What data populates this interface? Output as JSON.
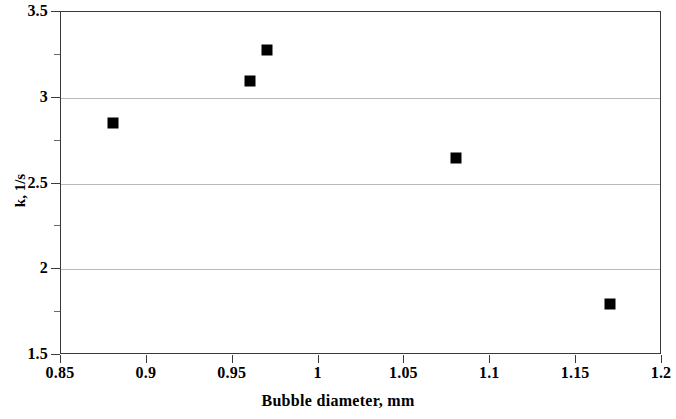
{
  "chart_data": {
    "type": "scatter",
    "title": "",
    "xlabel": "Bubble diameter, mm",
    "ylabel": "k, 1/s",
    "xlim": [
      0.85,
      1.2
    ],
    "ylim": [
      1.5,
      3.5
    ],
    "grid": "horizontal-major",
    "legend": "none",
    "marker": "filled-square-black",
    "marker_color": "#000000",
    "x": [
      0.88,
      0.96,
      0.97,
      1.08,
      1.17
    ],
    "y": [
      2.85,
      3.1,
      3.28,
      2.65,
      1.8
    ],
    "points": [
      {
        "x": 0.88,
        "y": 2.85
      },
      {
        "x": 0.96,
        "y": 3.1
      },
      {
        "x": 0.97,
        "y": 3.28
      },
      {
        "x": 1.08,
        "y": 2.65
      },
      {
        "x": 1.17,
        "y": 1.8
      }
    ],
    "x_ticks": [
      0.85,
      0.9,
      0.95,
      1,
      1.05,
      1.1,
      1.15,
      1.2
    ],
    "x_tick_labels": [
      "0.85",
      "0.9",
      "0.95",
      "1",
      "1.05",
      "1.1",
      "1.15",
      "1.2"
    ],
    "y_ticks": [
      1.5,
      2,
      2.5,
      3,
      3.5
    ],
    "y_tick_labels": [
      "1.5",
      "2",
      "2.5",
      "3",
      "3.5"
    ],
    "y_minor_ticks": [
      1.75,
      2.25,
      2.75,
      3.25
    ],
    "gridline_values": [
      2,
      2.5,
      3
    ],
    "gridline_color": "#b9b9b9",
    "axis_color": "#3a3a3a",
    "background": "#ffffff"
  }
}
